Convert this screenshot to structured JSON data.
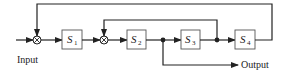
{
  "diagram": {
    "type": "block-diagram",
    "labels": {
      "input": "Input",
      "output": "Output"
    },
    "blocks": [
      {
        "id": "S1",
        "symbol": "S",
        "subscript": "1"
      },
      {
        "id": "S2",
        "symbol": "S",
        "subscript": "2"
      },
      {
        "id": "S3",
        "symbol": "S",
        "subscript": "3"
      },
      {
        "id": "S4",
        "symbol": "S",
        "subscript": "4"
      }
    ],
    "summing_junctions": [
      {
        "id": "sum1",
        "symbol": "⊗",
        "inputs": [
          "Input",
          "S4 output (feedback)"
        ],
        "output": "S1"
      },
      {
        "id": "sum2",
        "symbol": "⊗",
        "inputs": [
          "S1 output",
          "S3 output (feedback)"
        ],
        "output": "S2"
      }
    ],
    "connections": [
      "Input → sum1",
      "sum1 → S1",
      "S1 → sum2",
      "sum2 → S2",
      "S2 → node1",
      "node1 → S3",
      "node1 → Output",
      "S3 → node2",
      "node2 → S4",
      "node2 → sum2 (feedback)",
      "S4 → sum1 (feedback)"
    ],
    "colors": {
      "line": "#222222",
      "background": "#ffffff"
    }
  }
}
